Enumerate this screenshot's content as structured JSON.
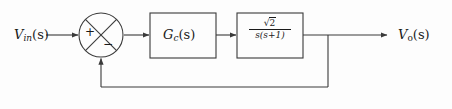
{
  "diagram": {
    "kind": "control-system-block-diagram",
    "background_color": "#fdfdfd",
    "line_color": "#3a3a3a",
    "text_color": "#1a1a1a"
  },
  "input": {
    "label_main": "V",
    "label_sub": "in",
    "label_arg": "(s)",
    "label_full": "V_in(s)"
  },
  "output": {
    "label_main": "V",
    "label_sub": "o",
    "label_arg": "(s)",
    "label_full": "V_o(s)"
  },
  "summing_junction": {
    "name": "summing-junction",
    "shape": "circle-with-x",
    "plus_sign": "+",
    "minus_sign": "−",
    "plus_position": "left",
    "minus_position": "bottom",
    "center_x": 101,
    "center_y": 35,
    "radius": 22
  },
  "blocks": [
    {
      "name": "controller-block",
      "label": "G",
      "label_sub": "c",
      "label_arg": "(s)",
      "label_full": "G_c(s)",
      "x": 150,
      "y": 13,
      "width": 66,
      "height": 45
    },
    {
      "name": "plant-block",
      "numerator": "√2",
      "numerator_radicand": "2",
      "denominator": "s(s+1)",
      "label_full": "sqrt(2)/(s(s+1))",
      "x": 237,
      "y": 13,
      "width": 66,
      "height": 45
    }
  ],
  "feedback": {
    "name": "feedback-path",
    "type": "unity",
    "takeoff_x": 328,
    "bottom_y": 87,
    "enters_at": "summing-junction-bottom",
    "sign": "−"
  },
  "signals": [
    {
      "name": "input-signal-line",
      "from_x": 46,
      "to_x": 79,
      "y": 35
    },
    {
      "name": "error-signal-line",
      "from_x": 124,
      "to_x": 150,
      "y": 35
    },
    {
      "name": "controller-output-line",
      "from_x": 216,
      "to_x": 237,
      "y": 35
    },
    {
      "name": "plant-output-line",
      "from_x": 303,
      "to_x": 388,
      "y": 35
    }
  ]
}
